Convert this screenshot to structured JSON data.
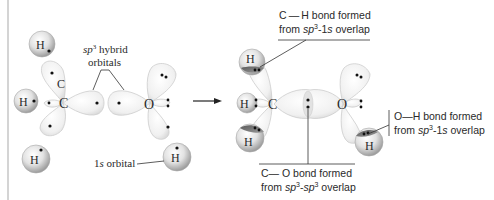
{
  "diagram": {
    "left": {
      "atoms": {
        "carbon": "C",
        "carbon_lobe_label": "C",
        "oxygen": "O",
        "hydrogen": "H"
      },
      "labels": {
        "sp3_line1_italic": "sp",
        "sp3_superscript": "3",
        "sp3_line1_rest": " hybrid",
        "sp3_line2": "orbitals",
        "s_orbital_prefix": "1",
        "s_orbital_italic": "s",
        "s_orbital_rest": " orbital"
      }
    },
    "arrow": "reaction-arrow",
    "right": {
      "atoms": {
        "carbon": "C",
        "oxygen": "O",
        "hydrogen": "H"
      },
      "callouts": {
        "ch_bond": {
          "line1": "C — H bond formed",
          "line2_prefix": "from ",
          "line2_italic": "sp",
          "line2_sup": "3",
          "line2_rest": "-1",
          "line2_italic2": "s",
          "line2_end": " overlap"
        },
        "co_bond": {
          "line1": "C— O bond formed",
          "line2_prefix": "from ",
          "line2_italic": "sp",
          "line2_sup": "3",
          "line2_mid": "-",
          "line2_italic2": "sp",
          "line2_sup2": "3",
          "line2_end": " overlap"
        },
        "oh_bond": {
          "line1": "O—H bond formed",
          "line2_prefix": "from ",
          "line2_italic": "sp",
          "line2_sup": "3",
          "line2_rest": "-1",
          "line2_italic2": "s",
          "line2_end": " overlap"
        }
      }
    },
    "colors": {
      "lobe_fill": "#f2f2f2",
      "lobe_stroke": "#c9c9c9",
      "sphere_light": "#f4f4f4",
      "sphere_dark": "#9a9a9a",
      "overlap_dark": "#7a7a7a",
      "text": "#2a2a2a"
    }
  }
}
